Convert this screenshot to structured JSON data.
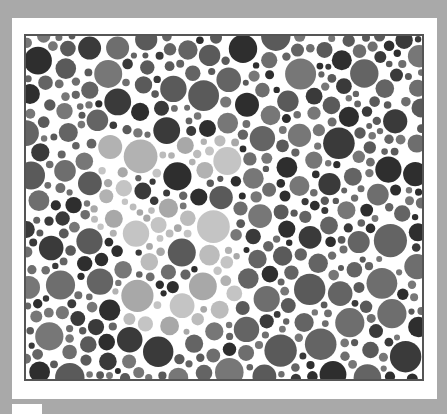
{
  "plate": {
    "type": "ishihara-color-vision-test",
    "hidden_number": "5",
    "caption": "Color vision test plate"
  },
  "colors": {
    "page_background": "#a9a9a9",
    "card_background": "#ffffff",
    "plate_border": "#555555",
    "background_dots": [
      "#5a5a5a",
      "#646464",
      "#6e6e6e",
      "#3a3a3a",
      "#2e2e2e",
      "#777777"
    ],
    "figure_dots": [
      "#a8a8a8",
      "#b2b2b2",
      "#bcbcbc",
      "#c4c4c4"
    ]
  },
  "generation": {
    "seed": 7,
    "width": 396,
    "height": 343,
    "attempts": 9000,
    "max_radius": 17,
    "min_radius": 3,
    "gap": 2
  },
  "figure_mask": {
    "rects": [
      [
        66,
        104,
        150,
        36
      ],
      [
        66,
        104,
        40,
        82
      ],
      [
        66,
        170,
        110,
        36
      ]
    ],
    "bowl": {
      "cx": 148,
      "cy": 238,
      "rx": 72,
      "ry": 62,
      "inner_rx": 28,
      "inner_ry": 24,
      "open_left_x": 120,
      "open_top_y": 232
    }
  }
}
